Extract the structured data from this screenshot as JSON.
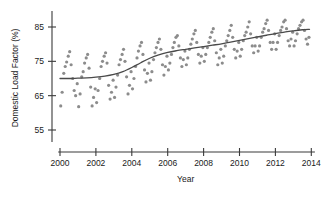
{
  "chart_data": {
    "type": "scatter",
    "title": "",
    "subtitle": "",
    "xlabel": "Year",
    "ylabel": "Domestic Load Factor (%)",
    "xlim": [
      1999.6,
      2014.3
    ],
    "ylim": [
      52.0,
      89.0
    ],
    "xticks": [
      2000,
      2002,
      2004,
      2006,
      2008,
      2010,
      2012,
      2014
    ],
    "xtick_labels": [
      "2000",
      "2002",
      "2004",
      "2006",
      "2008",
      "2010",
      "2012",
      "2014"
    ],
    "yticks": [
      55,
      65,
      75,
      85
    ],
    "ytick_labels": [
      "55",
      "65",
      "75",
      "85"
    ],
    "grid": false,
    "legend": null,
    "legend_position": "none",
    "axis_style": "detached-offset",
    "point_color": "#8c8c8c",
    "point_radius": 1.6,
    "line_color": "#4a4a4a",
    "series": [
      {
        "name": "Monthly domestic load factor",
        "marker": "circle",
        "x": [
          2000.04,
          2000.12,
          2000.21,
          2000.29,
          2000.37,
          2000.46,
          2000.54,
          2000.62,
          2000.71,
          2000.79,
          2000.87,
          2000.96,
          2001.04,
          2001.12,
          2001.21,
          2001.29,
          2001.37,
          2001.46,
          2001.54,
          2001.62,
          2001.71,
          2001.79,
          2001.87,
          2001.96,
          2002.04,
          2002.12,
          2002.21,
          2002.29,
          2002.37,
          2002.46,
          2002.54,
          2002.62,
          2002.71,
          2002.79,
          2002.87,
          2002.96,
          2003.04,
          2003.12,
          2003.21,
          2003.29,
          2003.37,
          2003.46,
          2003.54,
          2003.62,
          2003.71,
          2003.79,
          2003.87,
          2003.96,
          2004.04,
          2004.12,
          2004.21,
          2004.29,
          2004.37,
          2004.46,
          2004.54,
          2004.62,
          2004.71,
          2004.79,
          2004.87,
          2004.96,
          2005.04,
          2005.12,
          2005.21,
          2005.29,
          2005.37,
          2005.46,
          2005.54,
          2005.62,
          2005.71,
          2005.79,
          2005.87,
          2005.96,
          2006.04,
          2006.12,
          2006.21,
          2006.29,
          2006.37,
          2006.46,
          2006.54,
          2006.62,
          2006.71,
          2006.79,
          2006.87,
          2006.96,
          2007.04,
          2007.12,
          2007.21,
          2007.29,
          2007.37,
          2007.46,
          2007.54,
          2007.62,
          2007.71,
          2007.79,
          2007.87,
          2007.96,
          2008.04,
          2008.12,
          2008.21,
          2008.29,
          2008.37,
          2008.46,
          2008.54,
          2008.62,
          2008.71,
          2008.79,
          2008.87,
          2008.96,
          2009.04,
          2009.12,
          2009.21,
          2009.29,
          2009.37,
          2009.46,
          2009.54,
          2009.62,
          2009.71,
          2009.79,
          2009.87,
          2009.96,
          2010.04,
          2010.12,
          2010.21,
          2010.29,
          2010.37,
          2010.46,
          2010.54,
          2010.62,
          2010.71,
          2010.79,
          2010.87,
          2010.96,
          2011.04,
          2011.12,
          2011.21,
          2011.29,
          2011.37,
          2011.46,
          2011.54,
          2011.62,
          2011.71,
          2011.79,
          2011.87,
          2011.96,
          2012.04,
          2012.12,
          2012.21,
          2012.29,
          2012.37,
          2012.46,
          2012.54,
          2012.62,
          2012.71,
          2012.79,
          2012.87,
          2012.96,
          2013.04,
          2013.12,
          2013.21,
          2013.29,
          2013.37,
          2013.46,
          2013.54,
          2013.62,
          2013.71,
          2013.79,
          2013.87
        ],
        "y": [
          62.0,
          66.0,
          71.5,
          73.5,
          74.8,
          76.5,
          77.8,
          74.0,
          70.0,
          66.5,
          65.0,
          68.5,
          61.8,
          65.5,
          70.5,
          72.0,
          74.5,
          76.0,
          77.0,
          73.0,
          67.5,
          62.0,
          64.5,
          67.0,
          63.0,
          66.5,
          70.0,
          73.5,
          75.0,
          76.5,
          77.5,
          74.5,
          68.0,
          64.0,
          66.0,
          69.5,
          64.5,
          67.5,
          71.0,
          74.0,
          75.5,
          77.0,
          78.5,
          75.0,
          70.5,
          65.5,
          68.0,
          72.0,
          67.0,
          70.0,
          73.5,
          76.0,
          78.0,
          79.5,
          80.5,
          77.0,
          72.5,
          69.0,
          71.5,
          74.5,
          69.5,
          72.0,
          75.5,
          77.5,
          79.0,
          80.5,
          81.5,
          78.5,
          74.0,
          71.0,
          73.5,
          76.5,
          72.5,
          74.5,
          77.0,
          79.0,
          80.5,
          82.0,
          82.5,
          79.5,
          76.0,
          73.5,
          75.5,
          78.0,
          74.0,
          76.0,
          78.5,
          80.0,
          81.5,
          83.0,
          84.0,
          80.5,
          77.0,
          74.5,
          76.5,
          79.0,
          75.0,
          77.0,
          79.0,
          80.5,
          82.0,
          83.5,
          84.5,
          81.0,
          77.5,
          74.0,
          76.0,
          78.5,
          74.5,
          76.5,
          79.5,
          81.0,
          82.5,
          84.0,
          85.5,
          82.0,
          78.5,
          76.0,
          78.0,
          80.5,
          76.5,
          78.5,
          81.0,
          82.5,
          83.5,
          85.0,
          86.5,
          83.0,
          79.5,
          77.5,
          79.5,
          82.0,
          78.0,
          79.5,
          82.0,
          83.5,
          84.5,
          86.0,
          87.0,
          84.0,
          80.5,
          78.5,
          80.5,
          83.0,
          78.5,
          80.5,
          82.5,
          84.0,
          85.0,
          86.5,
          87.0,
          84.5,
          81.0,
          79.5,
          81.5,
          83.5,
          79.5,
          81.0,
          83.0,
          84.5,
          85.5,
          86.5,
          87.0,
          84.0,
          81.5,
          80.0,
          82.0
        ]
      }
    ],
    "trend": {
      "name": "Smoothed trend (LOESS)",
      "x": [
        2000.0,
        2000.5,
        2001.0,
        2001.5,
        2002.0,
        2002.5,
        2003.0,
        2003.5,
        2004.0,
        2004.5,
        2005.0,
        2005.5,
        2006.0,
        2006.5,
        2007.0,
        2007.5,
        2008.0,
        2008.5,
        2009.0,
        2009.5,
        2010.0,
        2010.5,
        2011.0,
        2011.5,
        2012.0,
        2012.5,
        2013.0,
        2013.5,
        2013.9
      ],
      "y": [
        70.0,
        70.0,
        70.1,
        70.2,
        70.4,
        70.7,
        71.2,
        72.0,
        73.2,
        74.6,
        75.9,
        76.9,
        77.6,
        78.1,
        78.5,
        78.9,
        79.3,
        79.7,
        80.1,
        80.6,
        81.1,
        81.6,
        82.1,
        82.6,
        83.1,
        83.5,
        83.9,
        84.2,
        84.3
      ]
    }
  }
}
